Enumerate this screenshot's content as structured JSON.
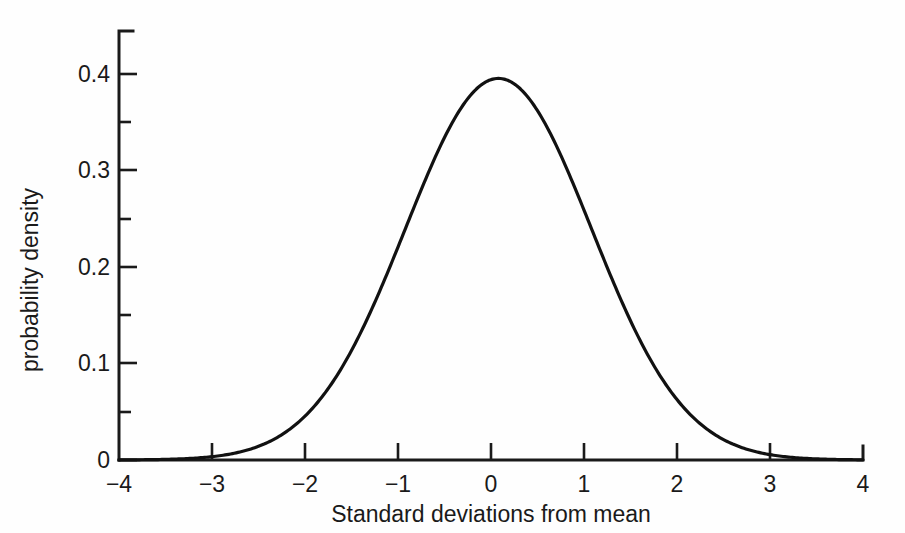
{
  "chart_data": {
    "type": "line",
    "title": "",
    "subtitle": "",
    "xlabel": "Standard deviations from mean",
    "ylabel": "probability density",
    "xlim": [
      -4,
      4
    ],
    "ylim": [
      0,
      0.45
    ],
    "grid": false,
    "legend": null,
    "annotations": [],
    "x_ticks": [
      -4,
      -3,
      -2,
      -1,
      0,
      1,
      2,
      3,
      4
    ],
    "x_tick_labels": [
      "−4",
      "−3",
      "−2",
      "−1",
      "0",
      "1",
      "2",
      "3",
      "4"
    ],
    "y_ticks": [
      0,
      0.1,
      0.2,
      0.3,
      0.4
    ],
    "y_tick_labels": [
      "0",
      "0.1",
      "0.2",
      "0.3",
      "0.4"
    ],
    "y_minor_ticks": [
      0.05,
      0.15,
      0.25,
      0.35,
      0.45
    ],
    "series": [
      {
        "name": "standard normal density",
        "mean": 0.08,
        "sigma": 1.0,
        "peak_value": 0.395,
        "x": [
          -4,
          -3.8,
          -3.6,
          -3.4,
          -3.2,
          -3,
          -2.8,
          -2.6,
          -2.4,
          -2.2,
          -2,
          -1.8,
          -1.6,
          -1.4,
          -1.2,
          -1,
          -0.8,
          -0.6,
          -0.4,
          -0.2,
          0,
          0.2,
          0.4,
          0.6,
          0.8,
          1,
          1.2,
          1.4,
          1.6,
          1.8,
          2,
          2.2,
          2.4,
          2.6,
          2.8,
          3,
          3.2,
          3.4,
          3.6,
          3.8,
          4
        ],
        "values": [
          0.0001,
          0.0002,
          0.0004,
          0.0009,
          0.0018,
          0.0035,
          0.0065,
          0.0115,
          0.0196,
          0.0317,
          0.0488,
          0.0713,
          0.0989,
          0.1295,
          0.1604,
          0.1876,
          0.2083,
          0.2203,
          0.2234,
          0.2179,
          0.2051,
          0.1866,
          0.1645,
          0.1406,
          0.1165,
          0.0936,
          0.0727,
          0.0546,
          0.0396,
          0.0278,
          0.0188,
          0.0123,
          0.0077,
          0.0047,
          0.0027,
          0.0015,
          0.0008,
          0.0004,
          0.0002,
          0.0001,
          5e-05
        ]
      }
    ]
  },
  "axes": {
    "x_axis_name": "Standard deviations from mean",
    "y_axis_name": "probability density"
  }
}
